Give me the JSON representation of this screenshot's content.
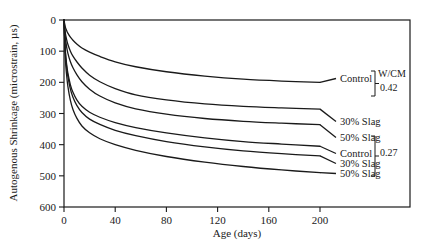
{
  "chart_data": {
    "type": "line",
    "title": "",
    "xlabel": "Age (days)",
    "ylabel": "Autogenous Shrinkage (microstrain, µs)",
    "xlim": [
      0,
      200
    ],
    "ylim": [
      0,
      600
    ],
    "y_inverted": true,
    "xticks": [
      0,
      40,
      80,
      120,
      160,
      200
    ],
    "yticks": [
      0,
      100,
      200,
      300,
      400,
      500,
      600
    ],
    "grid": false,
    "legend_position": "right-inline",
    "x": [
      0,
      1,
      2,
      3,
      5,
      7,
      10,
      14,
      20,
      28,
      40,
      56,
      80,
      110,
      140,
      170,
      200
    ],
    "series": [
      {
        "name": "Control",
        "group": "0.42",
        "label": "Control",
        "values": [
          0,
          22,
          33,
          42,
          55,
          65,
          77,
          90,
          103,
          117,
          134,
          150,
          166,
          180,
          190,
          196,
          200
        ]
      },
      {
        "name": "30% Slag",
        "group": "0.42",
        "label": "30% Slag",
        "values": [
          0,
          40,
          62,
          78,
          100,
          116,
          134,
          154,
          177,
          198,
          220,
          240,
          256,
          269,
          277,
          282,
          286
        ]
      },
      {
        "name": "50% Slag",
        "group": "0.42",
        "label": "50% Slag",
        "values": [
          0,
          55,
          85,
          106,
          134,
          153,
          175,
          198,
          222,
          244,
          266,
          285,
          302,
          316,
          325,
          331,
          336
        ]
      },
      {
        "name": "Control",
        "group": "0.27",
        "label": "Control",
        "values": [
          0,
          95,
          140,
          170,
          208,
          232,
          256,
          277,
          296,
          312,
          329,
          345,
          362,
          378,
          390,
          398,
          405
        ]
      },
      {
        "name": "30% Slag",
        "group": "0.27",
        "label": "30% Slag",
        "values": [
          0,
          100,
          148,
          180,
          222,
          248,
          274,
          297,
          318,
          335,
          354,
          371,
          390,
          407,
          420,
          429,
          436
        ]
      },
      {
        "name": "50% Slag",
        "group": "0.27",
        "label": "50% Slag",
        "values": [
          0,
          120,
          175,
          212,
          258,
          287,
          315,
          340,
          362,
          381,
          400,
          418,
          438,
          456,
          470,
          481,
          490
        ]
      }
    ],
    "groups": [
      {
        "id": "g042",
        "bracket_label": "0.42",
        "header": "W/CM"
      },
      {
        "id": "g027",
        "bracket_label": "0.27",
        "header": ""
      }
    ],
    "tick_labels_x": [
      "0",
      "40",
      "80",
      "120",
      "160",
      "200"
    ],
    "tick_labels_y": [
      "0",
      "100",
      "200",
      "300",
      "400",
      "500",
      "600"
    ],
    "colors": {
      "line": "#1a1a1a",
      "axis": "#1a1a1a",
      "background": "#ffffff"
    }
  },
  "legend": {
    "wcm_header": "W/CM",
    "group_042": "0.42",
    "group_027": "0.27",
    "items_042": [
      "Control",
      "30% Slag",
      "50% Slag"
    ],
    "items_027": [
      "Control",
      "30% Slag",
      "50% Slag"
    ]
  }
}
